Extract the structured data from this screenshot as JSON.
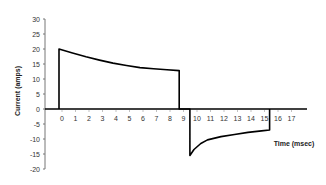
{
  "chart_data": {
    "type": "line",
    "title": "",
    "xlabel": "Time (msec)",
    "ylabel": "Current (amps)",
    "xlim": [
      0,
      18
    ],
    "ylim": [
      -20,
      30
    ],
    "grid": false,
    "legend": null,
    "x_ticks": [
      0,
      1,
      2,
      3,
      4,
      5,
      6,
      7,
      8,
      9,
      10,
      11,
      12,
      13,
      14,
      15,
      16,
      17
    ],
    "y_ticks": [
      30,
      25,
      20,
      15,
      10,
      5,
      0,
      -5,
      -10,
      -15,
      -20
    ],
    "series": [
      {
        "name": "Current",
        "color": "#000000",
        "points": [
          [
            0,
            0
          ],
          [
            0,
            20
          ],
          [
            1,
            18.7
          ],
          [
            2,
            17.4
          ],
          [
            3,
            16.3
          ],
          [
            4,
            15.3
          ],
          [
            5,
            14.5
          ],
          [
            6,
            13.8
          ],
          [
            7,
            13.4
          ],
          [
            8,
            13.1
          ],
          [
            8.9,
            12.8
          ],
          [
            8.9,
            0
          ],
          [
            9.7,
            0
          ],
          [
            9.7,
            -15.5
          ],
          [
            10,
            -13.5
          ],
          [
            10.5,
            -11.5
          ],
          [
            11,
            -10.3
          ],
          [
            12,
            -9.2
          ],
          [
            13,
            -8.5
          ],
          [
            14,
            -7.8
          ],
          [
            15,
            -7.3
          ],
          [
            15.6,
            -7.0
          ],
          [
            15.6,
            0
          ],
          [
            18,
            0
          ]
        ]
      }
    ]
  }
}
